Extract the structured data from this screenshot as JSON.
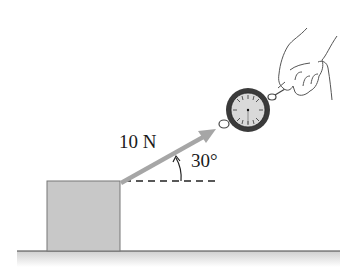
{
  "diagram": {
    "type": "physics-force-diagram",
    "force": {
      "magnitude_label": "10 N",
      "angle_label": "30°",
      "direction_deg": 30
    },
    "objects": [
      {
        "name": "block",
        "fill": "#c8c8c8"
      },
      {
        "name": "spring-scale",
        "face_fill": "#d9d9d9",
        "rim_fill": "#3a3a3a"
      },
      {
        "name": "hand"
      },
      {
        "name": "floor",
        "fill": "#d6d6d6"
      }
    ],
    "colors": {
      "arrow": "#a6a6a6",
      "line": "#333333",
      "block": "#c8c8c8"
    }
  }
}
